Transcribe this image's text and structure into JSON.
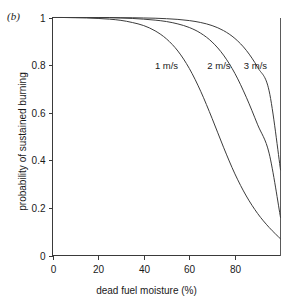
{
  "figure": {
    "panel_label": "(b)"
  },
  "chart_data": {
    "type": "line",
    "title": "",
    "subtitle": "",
    "panel": "(b)",
    "xlabel": "dead fuel moisture (%)",
    "ylabel": "probability of sustained burning",
    "xlim": [
      0,
      100
    ],
    "ylim": [
      0,
      1
    ],
    "xticks": [
      0,
      20,
      40,
      60,
      80
    ],
    "xticklabels": [
      "0",
      "20",
      "40",
      "60",
      "80"
    ],
    "yticks": [
      0,
      0.2,
      0.4,
      0.6,
      0.8,
      1
    ],
    "yticklabels": [
      "0",
      "0.2",
      "0.4",
      "0.6",
      "0.8",
      "1"
    ],
    "grid": false,
    "legend_position": "inline-annotations",
    "x": [
      0,
      5,
      10,
      15,
      20,
      25,
      30,
      35,
      40,
      45,
      50,
      55,
      60,
      65,
      70,
      75,
      80,
      85,
      90,
      95,
      100
    ],
    "series": [
      {
        "name": "1 m/s",
        "label": "1 m/s",
        "label_x": 50,
        "label_y": 0.8,
        "color": "#3c3c3c",
        "values": [
          1.0,
          1.0,
          0.999,
          0.998,
          0.996,
          0.993,
          0.988,
          0.979,
          0.966,
          0.944,
          0.91,
          0.859,
          0.786,
          0.69,
          0.576,
          0.455,
          0.343,
          0.25,
          0.176,
          0.118,
          0.07
        ]
      },
      {
        "name": "2 m/s",
        "label": "2 m/s",
        "label_x": 73,
        "label_y": 0.8,
        "color": "#3c3c3c",
        "values": [
          1.0,
          1.0,
          1.0,
          1.0,
          0.999,
          0.999,
          0.998,
          0.996,
          0.993,
          0.989,
          0.983,
          0.973,
          0.958,
          0.934,
          0.897,
          0.842,
          0.765,
          0.665,
          0.549,
          0.43,
          0.16
        ]
      },
      {
        "name": "3 m/s",
        "label": "3 m/s",
        "label_x": 89,
        "label_y": 0.8,
        "color": "#3c3c3c",
        "values": [
          1.0,
          1.0,
          1.0,
          1.0,
          1.0,
          1.0,
          0.999,
          0.999,
          0.998,
          0.997,
          0.995,
          0.992,
          0.987,
          0.979,
          0.966,
          0.945,
          0.912,
          0.862,
          0.79,
          0.692,
          0.36
        ]
      }
    ],
    "annotations": [
      {
        "text": "1 m/s",
        "x": 50,
        "y": 0.8
      },
      {
        "text": "2 m/s",
        "x": 73,
        "y": 0.8
      },
      {
        "text": "3 m/s",
        "x": 89,
        "y": 0.8
      }
    ]
  }
}
